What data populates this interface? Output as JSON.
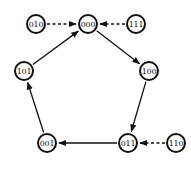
{
  "diagram": {
    "type": "state-transition-graph",
    "nodes": [
      {
        "id": "000",
        "label": "000",
        "x": 88,
        "y": 24
      },
      {
        "id": "100",
        "label": "100",
        "x": 149,
        "y": 71
      },
      {
        "id": "011",
        "label": "011",
        "x": 128,
        "y": 143
      },
      {
        "id": "001",
        "label": "001",
        "x": 47,
        "y": 143
      },
      {
        "id": "101",
        "label": "101",
        "x": 24,
        "y": 71
      },
      {
        "id": "010",
        "label": "010",
        "x": 36,
        "y": 24
      },
      {
        "id": "111",
        "label": "111",
        "x": 136,
        "y": 24
      },
      {
        "id": "110",
        "label": "110",
        "x": 176,
        "y": 143
      }
    ],
    "edges": [
      {
        "from": "000",
        "to": "100",
        "style": "solid"
      },
      {
        "from": "100",
        "to": "011",
        "style": "solid"
      },
      {
        "from": "011",
        "to": "001",
        "style": "solid"
      },
      {
        "from": "001",
        "to": "101",
        "style": "solid"
      },
      {
        "from": "101",
        "to": "000",
        "style": "solid"
      },
      {
        "from": "010",
        "to": "000",
        "style": "dashed"
      },
      {
        "from": "111",
        "to": "000",
        "style": "dashed"
      },
      {
        "from": "110",
        "to": "011",
        "style": "dashed"
      }
    ],
    "colors": {
      "stroke": "#111111",
      "background": "#ffffff"
    }
  }
}
